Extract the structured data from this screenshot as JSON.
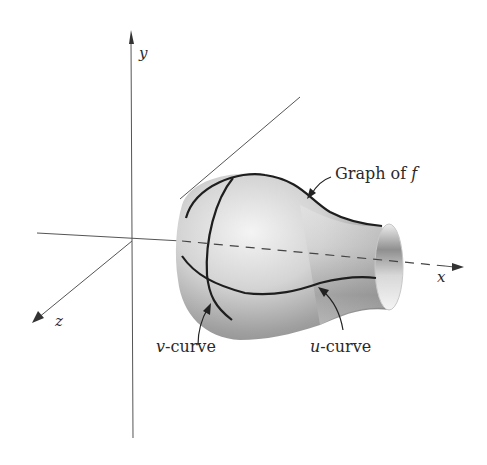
{
  "figure": {
    "axes": {
      "x_label": "x",
      "y_label": "y",
      "z_label": "z"
    },
    "annotations": {
      "graph_label_prefix": "Graph of ",
      "graph_label_var": "f",
      "v_curve_var": "v",
      "v_curve_suffix": "-curve",
      "u_curve_var": "u",
      "u_curve_suffix": "-curve"
    },
    "colors": {
      "axis": "#555555",
      "curve": "#1e1e1e",
      "surface_light": "#f2f2f2",
      "surface_dark": "#8c8c8c",
      "background": "#ffffff"
    }
  }
}
